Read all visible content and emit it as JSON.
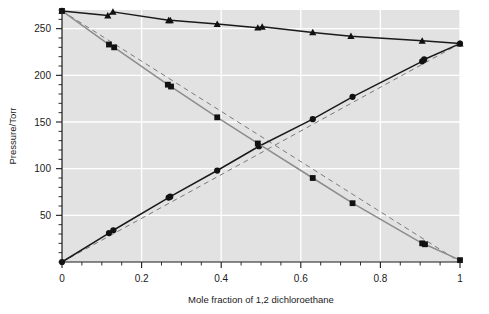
{
  "chart_data": {
    "type": "scatter",
    "title": "",
    "xlabel": "Mole fraction of 1,2 dichloroethane",
    "ylabel": "Pressure/Torr",
    "xlim": [
      0,
      1
    ],
    "ylim": [
      0,
      270
    ],
    "grid": true,
    "grid_color": "#ffffff",
    "plot_background": "#e2e2e2",
    "legend_position": "none",
    "xticks": [
      0,
      0.2,
      0.4,
      0.6,
      0.8,
      1
    ],
    "xtick_labels": [
      "0",
      "0.2",
      "0.4",
      "0.6",
      "0.8",
      "1"
    ],
    "xminor_step": 0.05,
    "yticks": [
      50,
      100,
      150,
      200,
      250
    ],
    "ytick_labels": [
      "50",
      "100",
      "150",
      "200",
      "250"
    ],
    "yminor_step": 10,
    "series": [
      {
        "name": "total-pressure",
        "marker": "triangle",
        "line_style": "solid",
        "color": "#1a1a1a",
        "points": [
          {
            "x": 0.0,
            "y": 269
          },
          {
            "x": 0.115,
            "y": 264
          },
          {
            "x": 0.128,
            "y": 268
          },
          {
            "x": 0.268,
            "y": 259
          },
          {
            "x": 0.272,
            "y": 259
          },
          {
            "x": 0.39,
            "y": 255
          },
          {
            "x": 0.492,
            "y": 251
          },
          {
            "x": 0.503,
            "y": 252
          },
          {
            "x": 0.63,
            "y": 246
          },
          {
            "x": 0.726,
            "y": 242
          },
          {
            "x": 0.905,
            "y": 237
          },
          {
            "x": 1.0,
            "y": 234
          }
        ]
      },
      {
        "name": "partial-pressure-dichloroethane",
        "marker": "circle",
        "line_style": "solid",
        "color": "#1a1a1a",
        "points": [
          {
            "x": 0.0,
            "y": 0
          },
          {
            "x": 0.118,
            "y": 31
          },
          {
            "x": 0.129,
            "y": 34
          },
          {
            "x": 0.268,
            "y": 69
          },
          {
            "x": 0.272,
            "y": 70
          },
          {
            "x": 0.39,
            "y": 98
          },
          {
            "x": 0.495,
            "y": 124
          },
          {
            "x": 0.63,
            "y": 153
          },
          {
            "x": 0.73,
            "y": 177
          },
          {
            "x": 0.905,
            "y": 215
          },
          {
            "x": 0.91,
            "y": 217
          },
          {
            "x": 1.0,
            "y": 234
          }
        ]
      },
      {
        "name": "partial-pressure-second-component",
        "marker": "square",
        "line_style": "solid",
        "color": "#8c8c8c",
        "points": [
          {
            "x": 0.0,
            "y": 269
          },
          {
            "x": 0.118,
            "y": 233
          },
          {
            "x": 0.131,
            "y": 230
          },
          {
            "x": 0.266,
            "y": 190
          },
          {
            "x": 0.274,
            "y": 188
          },
          {
            "x": 0.39,
            "y": 155
          },
          {
            "x": 0.492,
            "y": 127
          },
          {
            "x": 0.63,
            "y": 90
          },
          {
            "x": 0.73,
            "y": 63
          },
          {
            "x": 0.905,
            "y": 20
          },
          {
            "x": 0.912,
            "y": 19
          },
          {
            "x": 1.0,
            "y": 2
          }
        ]
      }
    ],
    "reference_lines": [
      {
        "name": "raoult-ideal-dichloroethane",
        "line_style": "dashed",
        "color": "#7a7a7a",
        "from": {
          "x": 0,
          "y": 0
        },
        "to": {
          "x": 1,
          "y": 234
        }
      },
      {
        "name": "raoult-ideal-second-component",
        "line_style": "dashed",
        "color": "#7a7a7a",
        "from": {
          "x": 0,
          "y": 269
        },
        "to": {
          "x": 1,
          "y": 0
        }
      }
    ]
  }
}
